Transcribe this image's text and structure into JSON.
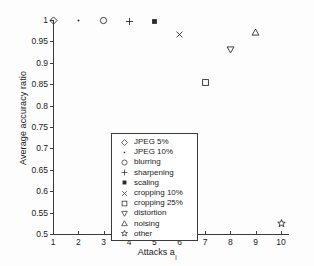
{
  "chart_data": {
    "type": "scatter",
    "title": "",
    "xlabel": "Attacks a",
    "xlabel_sub": "i",
    "ylabel": "Average accuracy ratio",
    "xlim": [
      1,
      10
    ],
    "ylim": [
      0.5,
      1.0
    ],
    "xticks": [
      "1",
      "2",
      "3",
      "4",
      "5",
      "6",
      "7",
      "8",
      "9",
      "10"
    ],
    "yticks": [
      "0.5",
      "0.55",
      "0.6",
      "0.65",
      "0.7",
      "0.75",
      "0.8",
      "0.85",
      "0.9",
      "0.95",
      "1"
    ],
    "grid": false,
    "legend_position": "lower-left-inside",
    "marker_color": "#2b2b2b",
    "axis_color": "#3b3b3b",
    "series": [
      {
        "name": "JPEG 5%",
        "marker": "diamond",
        "x": 1,
        "y": 1.0
      },
      {
        "name": "JPEG 10%",
        "marker": "dot",
        "x": 2,
        "y": 1.0
      },
      {
        "name": "blurring",
        "marker": "circle",
        "x": 3,
        "y": 0.998
      },
      {
        "name": "sharpening",
        "marker": "plus",
        "x": 4,
        "y": 0.996
      },
      {
        "name": "scaling",
        "marker": "filled-square",
        "x": 5,
        "y": 0.996
      },
      {
        "name": "cropping 10%",
        "marker": "cross",
        "x": 6,
        "y": 0.965
      },
      {
        "name": "cropping 25%",
        "marker": "open-square",
        "x": 7,
        "y": 0.855
      },
      {
        "name": "distortion",
        "marker": "triangle-down",
        "x": 8,
        "y": 0.932
      },
      {
        "name": "noising",
        "marker": "triangle-up",
        "x": 9,
        "y": 0.97
      },
      {
        "name": "other",
        "marker": "star",
        "x": 10,
        "y": 0.525
      }
    ],
    "legend": [
      {
        "label": "JPEG 5%",
        "marker": "diamond"
      },
      {
        "label": "JPEG 10%",
        "marker": "dot"
      },
      {
        "label": "blurring",
        "marker": "circle"
      },
      {
        "label": "sharpening",
        "marker": "plus"
      },
      {
        "label": "scaling",
        "marker": "filled-square"
      },
      {
        "label": "cropping 10%",
        "marker": "cross"
      },
      {
        "label": "cropping 25%",
        "marker": "open-square"
      },
      {
        "label": "distortion",
        "marker": "triangle-down"
      },
      {
        "label": "noising",
        "marker": "triangle-up"
      },
      {
        "label": "other",
        "marker": "star"
      }
    ]
  }
}
